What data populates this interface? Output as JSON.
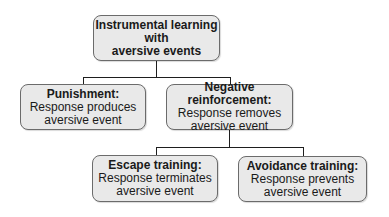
{
  "diagram": {
    "type": "tree",
    "root": {
      "id": "instrumental",
      "lines": [
        "Instrumental learning",
        "with",
        "aversive events"
      ]
    },
    "level1": [
      {
        "id": "punishment",
        "title": "Punishment:",
        "lines": [
          "Response produces",
          "aversive event"
        ]
      },
      {
        "id": "negative-reinforcement",
        "title": "Negative reinforcement:",
        "lines": [
          "Response removes",
          "aversive event"
        ]
      }
    ],
    "level2": [
      {
        "id": "escape-training",
        "title": "Escape training:",
        "lines": [
          "Response terminates",
          "aversive event"
        ]
      },
      {
        "id": "avoidance-training",
        "title": "Avoidance training:",
        "lines": [
          "Response prevents",
          "aversive event"
        ]
      }
    ],
    "edges": [
      [
        "instrumental",
        "punishment"
      ],
      [
        "instrumental",
        "negative-reinforcement"
      ],
      [
        "negative-reinforcement",
        "escape-training"
      ],
      [
        "negative-reinforcement",
        "avoidance-training"
      ]
    ],
    "colors": {
      "box_fill": "#e9e9e9",
      "box_border": "#6b6b6b",
      "line": "#1e1e1e"
    }
  }
}
